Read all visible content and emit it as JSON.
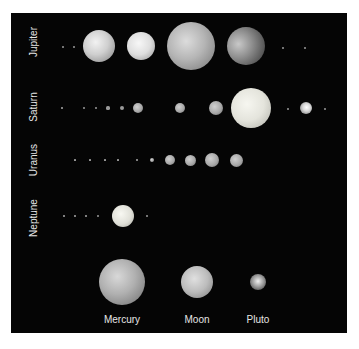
{
  "figure": {
    "row_labels": [
      "Jupiter",
      "Saturn",
      "Uranus",
      "Neptune"
    ],
    "bottom_labels": [
      "Mercury",
      "Moon",
      "Pluto"
    ],
    "colors": {
      "background": "#050505",
      "label": "#e6e6e6",
      "page": "#ffffff"
    }
  },
  "rows": [
    {
      "planet": "Jupiter",
      "label_pos": [
        33,
        42
      ],
      "bodies": [
        {
          "cx": 63,
          "cy": 47,
          "r": 1,
          "kind": "dot"
        },
        {
          "cx": 74,
          "cy": 47,
          "r": 1,
          "kind": "dot"
        },
        {
          "cx": 99,
          "cy": 46,
          "r": 16,
          "shade": "io"
        },
        {
          "cx": 141,
          "cy": 46,
          "r": 14,
          "shade": "europa"
        },
        {
          "cx": 191,
          "cy": 46,
          "r": 24,
          "shade": "ganymede"
        },
        {
          "cx": 246,
          "cy": 46,
          "r": 19,
          "shade": "callisto"
        },
        {
          "cx": 283,
          "cy": 48,
          "r": 1.2,
          "kind": "dot"
        },
        {
          "cx": 305,
          "cy": 48,
          "r": 1,
          "kind": "dot"
        }
      ]
    },
    {
      "planet": "Saturn",
      "label_pos": [
        33,
        107
      ],
      "bodies": [
        {
          "cx": 62,
          "cy": 108,
          "r": 0.8,
          "kind": "dot"
        },
        {
          "cx": 84,
          "cy": 108,
          "r": 1,
          "kind": "dot"
        },
        {
          "cx": 96,
          "cy": 108,
          "r": 1.2,
          "kind": "dot"
        },
        {
          "cx": 108,
          "cy": 108,
          "r": 1.6,
          "kind": "dot"
        },
        {
          "cx": 122,
          "cy": 108,
          "r": 2,
          "kind": "dot"
        },
        {
          "cx": 138,
          "cy": 108,
          "r": 5,
          "shade": "grey"
        },
        {
          "cx": 180,
          "cy": 108,
          "r": 5,
          "shade": "grey"
        },
        {
          "cx": 216,
          "cy": 108,
          "r": 7,
          "shade": "grey"
        },
        {
          "cx": 251,
          "cy": 108,
          "r": 20,
          "shade": "titan"
        },
        {
          "cx": 288,
          "cy": 109,
          "r": 1.2,
          "kind": "dot"
        },
        {
          "cx": 306,
          "cy": 108,
          "r": 6,
          "shade": "iapetus"
        },
        {
          "cx": 325,
          "cy": 109,
          "r": 1.2,
          "kind": "dot"
        }
      ]
    },
    {
      "planet": "Uranus",
      "label_pos": [
        33,
        160
      ],
      "bodies": [
        {
          "cx": 75,
          "cy": 160,
          "r": 0.6,
          "kind": "dot"
        },
        {
          "cx": 90,
          "cy": 160,
          "r": 0.6,
          "kind": "dot"
        },
        {
          "cx": 105,
          "cy": 160,
          "r": 0.6,
          "kind": "dot"
        },
        {
          "cx": 118,
          "cy": 160,
          "r": 0.6,
          "kind": "dot"
        },
        {
          "cx": 137,
          "cy": 160,
          "r": 0.8,
          "kind": "dot"
        },
        {
          "cx": 152,
          "cy": 160,
          "r": 2,
          "shade": "grey"
        },
        {
          "cx": 170,
          "cy": 160,
          "r": 5,
          "shade": "grey"
        },
        {
          "cx": 190,
          "cy": 160,
          "r": 5.5,
          "shade": "grey"
        },
        {
          "cx": 212,
          "cy": 160,
          "r": 7,
          "shade": "grey"
        },
        {
          "cx": 236,
          "cy": 160,
          "r": 6.5,
          "shade": "grey"
        }
      ]
    },
    {
      "planet": "Neptune",
      "label_pos": [
        33,
        218
      ],
      "bodies": [
        {
          "cx": 64,
          "cy": 216,
          "r": 0.8,
          "kind": "dot"
        },
        {
          "cx": 75,
          "cy": 216,
          "r": 0.8,
          "kind": "dot"
        },
        {
          "cx": 86,
          "cy": 216,
          "r": 0.8,
          "kind": "dot"
        },
        {
          "cx": 98,
          "cy": 216,
          "r": 1.2,
          "kind": "dot"
        },
        {
          "cx": 123,
          "cy": 216,
          "r": 11,
          "shade": "triton"
        },
        {
          "cx": 147,
          "cy": 216,
          "r": 1,
          "kind": "dot"
        }
      ]
    }
  ],
  "comparison": [
    {
      "name": "Mercury",
      "cx": 122,
      "cy": 282,
      "r": 23,
      "shade": "mercury",
      "label_y": 314
    },
    {
      "name": "Moon",
      "cx": 197,
      "cy": 282,
      "r": 16,
      "shade": "moon",
      "label_y": 314
    },
    {
      "name": "Pluto",
      "cx": 258,
      "cy": 282,
      "r": 8,
      "shade": "pluto",
      "label_y": 314
    }
  ]
}
